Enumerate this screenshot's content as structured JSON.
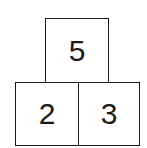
{
  "diagram": {
    "type": "number-pyramid",
    "top": {
      "value": "5"
    },
    "bottom": [
      {
        "value": "2"
      },
      {
        "value": "3"
      }
    ],
    "colors": {
      "stroke": "#1a1a1a",
      "fill": "#ffffff",
      "text": "#1a1a1a"
    }
  }
}
